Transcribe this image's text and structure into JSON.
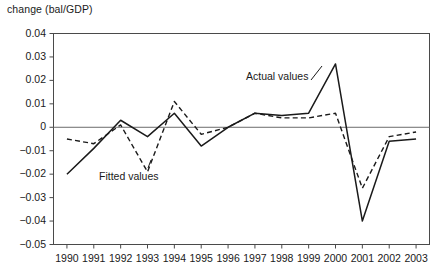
{
  "chart_data": {
    "type": "line",
    "title": "",
    "ylabel": "change (bal/GDP)",
    "xlabel": "",
    "categories": [
      "1990",
      "1991",
      "1992",
      "1993",
      "1994",
      "1995",
      "1996",
      "1997",
      "1998",
      "1999",
      "2000",
      "2001",
      "2002",
      "2003"
    ],
    "ylim": [
      -0.05,
      0.04
    ],
    "yticks": [
      "0.04",
      "0.03",
      "0.02",
      "0.01",
      "0",
      "−0.01",
      "−0.02",
      "−0.03",
      "−0.04",
      "−0.05"
    ],
    "ytick_values": [
      0.04,
      0.03,
      0.02,
      0.01,
      0,
      -0.01,
      -0.02,
      -0.03,
      -0.04,
      -0.05
    ],
    "grid": false,
    "legend_position": "inline-annotations",
    "zero_line": true,
    "series": [
      {
        "name": "Actual values",
        "style": "solid",
        "color": "#1a1a1a",
        "values": [
          -0.02,
          -0.009,
          0.003,
          -0.004,
          0.006,
          -0.008,
          0.0,
          0.006,
          0.005,
          0.006,
          0.027,
          -0.04,
          -0.006,
          -0.005
        ]
      },
      {
        "name": "Fitted values",
        "style": "dashed",
        "color": "#1a1a1a",
        "values": [
          -0.005,
          -0.007,
          0.001,
          -0.019,
          0.011,
          -0.003,
          0.0,
          0.006,
          0.004,
          0.004,
          0.006,
          -0.026,
          -0.004,
          -0.002
        ]
      }
    ],
    "annotations": [
      {
        "text": "Actual values",
        "series": "Actual values"
      },
      {
        "text": "Fitted values",
        "series": "Fitted values"
      }
    ]
  },
  "axis_title": "change (bal/GDP)"
}
